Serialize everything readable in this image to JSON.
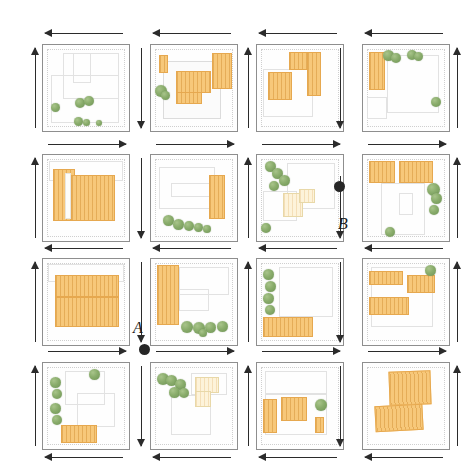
{
  "figure": {
    "type": "site-plan-matrix",
    "grid": {
      "rows": 4,
      "cols": 4
    },
    "background_color": "#ffffff",
    "building_color": "#f7c87a",
    "building_outline_color": "#e6a84f",
    "tree_color": "#89ac6b",
    "arrow_color": "#2b2b2b",
    "plot_outline_color": "#8e8e8e"
  },
  "nodes": [
    {
      "id": "node-a",
      "label": "A",
      "dot_x": 144,
      "dot_y": 348,
      "label_x": 133,
      "label_y": 324
    },
    {
      "id": "node-b",
      "label": "B",
      "dot_x": 339,
      "dot_y": 187,
      "label_x": 338,
      "label_y": 219
    }
  ],
  "arrows": {
    "horizontal_rows": [
      {
        "row": "top-of-row-1",
        "direction": "left",
        "count": 4
      },
      {
        "row": "between-row-1-and-2",
        "direction": "right",
        "count": 4
      },
      {
        "row": "between-row-2-and-3",
        "direction": "left",
        "count": 4
      },
      {
        "row": "between-row-3-and-4",
        "direction": "right",
        "count": 4
      },
      {
        "row": "bottom-of-row-4",
        "direction": "left",
        "count": 4
      }
    ],
    "vertical_columns": [
      {
        "column": "left-of-col-1",
        "direction": "up"
      },
      {
        "column": "between-col-1-and-2",
        "direction": "down"
      },
      {
        "column": "between-col-2-and-3",
        "direction": "up"
      },
      {
        "column": "between-col-3-and-4",
        "direction": "down"
      },
      {
        "column": "right-of-col-4",
        "direction": "up"
      }
    ]
  },
  "cells": [
    {
      "id": "cell-r1c1",
      "row": 1,
      "col": 1,
      "buildings": 0,
      "trees": 6,
      "description": "empty plot with faint outlines and a cluster of trees at lower left"
    },
    {
      "id": "cell-r1c2",
      "row": 1,
      "col": 2,
      "buildings": 3,
      "trees": 2,
      "description": "L-shaped footprint with three orange volumes and trees on the west edge"
    },
    {
      "id": "cell-r1c3",
      "row": 1,
      "col": 3,
      "buildings": 3,
      "trees": 0,
      "description": "two large orange blocks forming a courtyard, no trees"
    },
    {
      "id": "cell-r1c4",
      "row": 1,
      "col": 4,
      "buildings": 1,
      "trees": 5,
      "description": "tall orange bar on the west with a row of trees along the north edge"
    },
    {
      "id": "cell-r2c1",
      "row": 2,
      "col": 1,
      "buildings": 2,
      "trees": 0,
      "description": "two broad orange bars filling the plot, pale inner courtyard strip"
    },
    {
      "id": "cell-r2c2",
      "row": 2,
      "col": 2,
      "buildings": 1,
      "trees": 5,
      "description": "single narrow orange building with trees clustered at the lower left"
    },
    {
      "id": "cell-r2c3",
      "row": 2,
      "col": 3,
      "buildings": 2,
      "trees": 5,
      "description": "pale cream structure at centre with a diagonal line of trees to the north-west"
    },
    {
      "id": "cell-r2c4",
      "row": 2,
      "col": 4,
      "buildings": 2,
      "trees": 4,
      "description": "two orange blocks along the north edge with trees on the east edge"
    },
    {
      "id": "cell-r3c1",
      "row": 3,
      "col": 1,
      "buildings": 2,
      "trees": 0,
      "description": "two stacked orange bars occupying most of the plot"
    },
    {
      "id": "cell-r3c2",
      "row": 3,
      "col": 2,
      "buildings": 1,
      "trees": 5,
      "description": "tall orange bar on the west and a row of trees along the south edge"
    },
    {
      "id": "cell-r3c3",
      "row": 3,
      "col": 3,
      "buildings": 1,
      "trees": 4,
      "description": "low orange bar on the south with trees stacked on the west edge"
    },
    {
      "id": "cell-r3c4",
      "row": 3,
      "col": 4,
      "buildings": 3,
      "trees": 1,
      "description": "three orange blocks, one tree at the north-east corner"
    },
    {
      "id": "cell-r4c1",
      "row": 4,
      "col": 1,
      "buildings": 1,
      "trees": 5,
      "description": "orange bar at the bottom with trees climbing the west edge"
    },
    {
      "id": "cell-r4c2",
      "row": 4,
      "col": 2,
      "buildings": 2,
      "trees": 5,
      "description": "pale cream footprints at the centre with trees to the north-west"
    },
    {
      "id": "cell-r4c3",
      "row": 4,
      "col": 3,
      "buildings": 3,
      "trees": 1,
      "description": "three orange volumes of differing sizes and one tree to the east"
    },
    {
      "id": "cell-r4c4",
      "row": 4,
      "col": 4,
      "buildings": 2,
      "trees": 0,
      "description": "two large skewed orange blocks filling the plot"
    }
  ]
}
